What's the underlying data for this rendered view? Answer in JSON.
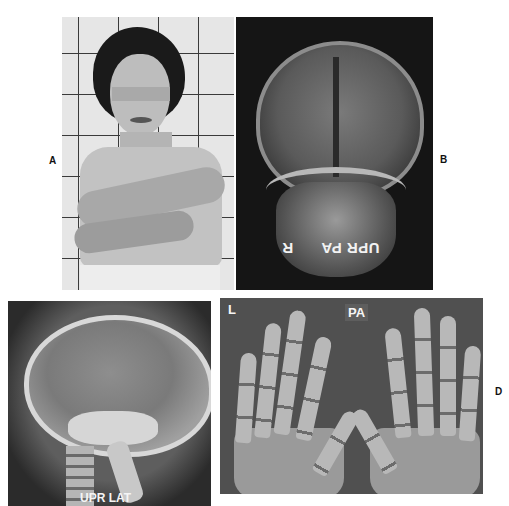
{
  "figure": {
    "panels": [
      {
        "id": "A",
        "label": "A",
        "content": "clinical photograph of woman with arms crossed against tiled wall, eyes masked"
      },
      {
        "id": "B",
        "label": "B",
        "content": "posteroanterior skull radiograph",
        "markers": {
          "side": "R",
          "view": "UPR PA"
        }
      },
      {
        "id": "C",
        "label": "",
        "content": "lateral skull radiograph",
        "markers": {
          "view": "UPR LAT"
        }
      },
      {
        "id": "D",
        "label": "D",
        "content": "posteroanterior radiograph of both hands",
        "markers": {
          "side": "L",
          "view": "PA"
        }
      }
    ]
  }
}
